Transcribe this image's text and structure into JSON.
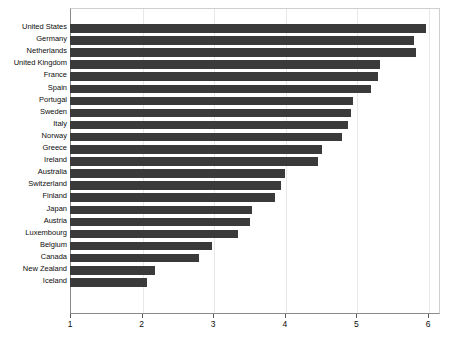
{
  "chart_data": {
    "type": "bar",
    "orientation": "horizontal",
    "title": "",
    "subtitle": "",
    "xlabel": "",
    "ylabel": "",
    "xlim": [
      1,
      6
    ],
    "ylim": null,
    "grid": true,
    "legend": null,
    "xticks": [
      "1",
      "2",
      "3",
      "4",
      "5",
      "6"
    ],
    "xtick_values": [
      1,
      2,
      3,
      4,
      5,
      6
    ],
    "bar_color": "#3a3a3a",
    "categories": [
      "United States",
      "Germany",
      "Netherlands",
      "United Kingdom",
      "France",
      "Spain",
      "Portugal",
      "Sweden",
      "Italy",
      "Norway",
      "Greece",
      "Ireland",
      "Australia",
      "Switzerland",
      "Finland",
      "Japan",
      "Austria",
      "Luxembourg",
      "Belgium",
      "Canada",
      "New Zealand",
      "Iceland"
    ],
    "values": [
      5.97,
      5.81,
      5.83,
      5.33,
      5.3,
      5.2,
      4.95,
      4.93,
      4.88,
      4.8,
      4.52,
      4.46,
      4.0,
      3.95,
      3.86,
      3.54,
      3.51,
      3.35,
      2.98,
      2.8,
      2.19,
      2.08
    ]
  }
}
